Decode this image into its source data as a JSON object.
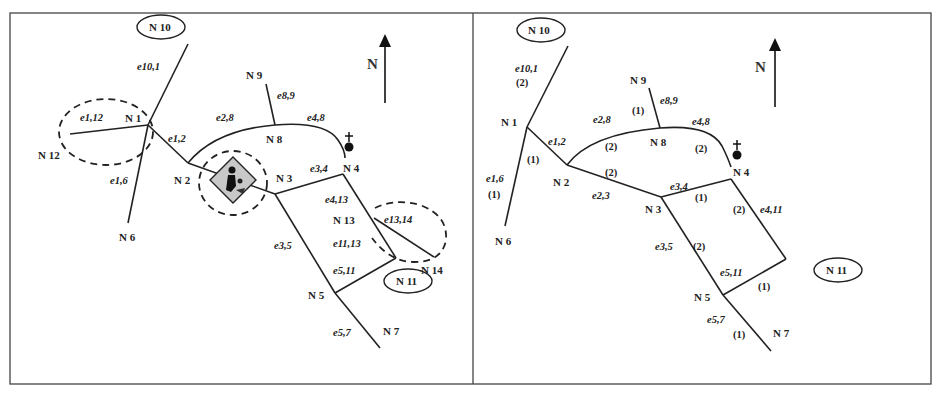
{
  "figure": {
    "caption": "",
    "north_label": "N"
  },
  "left_panel": {
    "nodes": {
      "n10": "N 10",
      "n1": "N 1",
      "n12": "N 12",
      "n6": "N 6",
      "n2": "N 2",
      "n9": "N 9",
      "n8": "N 8",
      "n3": "N 3",
      "n4": "N 4",
      "n13": "N 13",
      "n14": "N 14",
      "n11": "N 11",
      "n5": "N 5",
      "n7": "N 7"
    },
    "edges": {
      "e10_1": "e10,1",
      "e1_12": "e1,12",
      "e1_2": "e1,2",
      "e1_6": "e1,6",
      "e2_8": "e2,8",
      "e8_9": "e8,9",
      "e4_8": "e4,8",
      "e3_4": "e3,4",
      "e4_13": "e4,13",
      "e13_14": "e13,14",
      "e11_13": "e11,13",
      "e3_5": "e3,5",
      "e5_11": "e5,11",
      "e5_7": "e5,7"
    },
    "markers": [
      "hazard-roadwork-sign",
      "hospital-cross-marker",
      "dashed-zone-n1",
      "dashed-zone-n2",
      "dashed-zone-n13"
    ]
  },
  "right_panel": {
    "nodes": {
      "n10": "N 10",
      "n1": "N 1",
      "n6": "N 6",
      "n2": "N 2",
      "n9": "N 9",
      "n8": "N 8",
      "n3": "N 3",
      "n4": "N 4",
      "n11": "N 11",
      "n5": "N 5",
      "n7": "N 7"
    },
    "edges": {
      "e10_1": {
        "label": "e10,1",
        "weight": "(2)"
      },
      "e1_2": {
        "label": "e1,2",
        "weight": "(1)"
      },
      "e1_6": {
        "label": "e1,6",
        "weight": "(1)"
      },
      "e2_8": {
        "label": "e2,8",
        "weight": "(2)"
      },
      "e8_9": {
        "label": "e8,9",
        "weight": "(1)"
      },
      "e4_8": {
        "label": "e4,8",
        "weight": "(2)"
      },
      "e2_3": {
        "label": "e2,3",
        "weight": "(2)"
      },
      "e3_4": {
        "label": "e3,4",
        "weight": "(1)"
      },
      "e4_11": {
        "label": "e4,11",
        "weight": "(2)"
      },
      "e3_5": {
        "label": "e3,5",
        "weight": "(2)"
      },
      "e5_11": {
        "label": "e5,11",
        "weight": "(1)"
      },
      "e5_7": {
        "label": "e5,7",
        "weight": "(1)"
      }
    }
  }
}
